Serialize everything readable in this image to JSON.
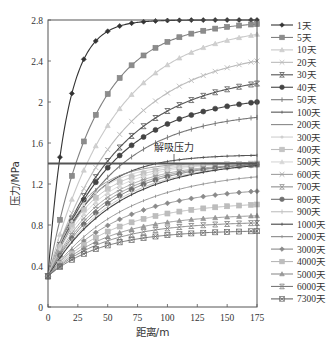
{
  "chart_data": {
    "type": "line",
    "title": "",
    "xlabel": "距离/m",
    "ylabel": "压力/MPa",
    "xlim": [
      0,
      175
    ],
    "ylim": [
      0,
      2.8
    ],
    "xticks": [
      0,
      25,
      50,
      75,
      100,
      125,
      150,
      175
    ],
    "yticks": [
      0,
      0.4,
      0.8,
      1.2,
      1.6,
      2,
      2.4,
      2.8
    ],
    "ytick_labels": [
      "0",
      "0.4",
      "0.8",
      "1.2",
      "1.6",
      "2",
      "2.4",
      "2.8"
    ],
    "grid": false,
    "legend_position": "right",
    "annotation": {
      "text": "解吸压力",
      "x": 100,
      "y": 1.4
    },
    "reference_line": {
      "name": "解吸压力",
      "y": 1.4,
      "color": "#555555"
    },
    "x": [
      0,
      10,
      20,
      30,
      40,
      50,
      60,
      70,
      80,
      90,
      100,
      110,
      120,
      130,
      140,
      150,
      160,
      170,
      175
    ],
    "series": [
      {
        "name": "1天",
        "final": 2.8,
        "k": 16,
        "color": "#333333",
        "marker": "diamond",
        "marker_fill": "#333333"
      },
      {
        "name": "5天",
        "final": 2.76,
        "k": 40,
        "color": "#808080",
        "marker": "square",
        "marker_fill": "#8c8c8c"
      },
      {
        "name": "10天",
        "final": 2.66,
        "k": 55,
        "color": "#c8c8c8",
        "marker": "triangle",
        "marker_fill": "#d0d0d0"
      },
      {
        "name": "20天",
        "final": 2.4,
        "k": 62,
        "color": "#bbbbbb",
        "marker": "x",
        "marker_fill": "#aaaaaa"
      },
      {
        "name": "30天",
        "final": 2.18,
        "k": 60,
        "color": "#555555",
        "marker": "xstar",
        "marker_fill": "#444444"
      },
      {
        "name": "40天",
        "final": 2.0,
        "k": 55,
        "color": "#444444",
        "marker": "circle",
        "marker_fill": "#444444"
      },
      {
        "name": "50天",
        "final": 1.85,
        "k": 55,
        "color": "#777777",
        "marker": "plus",
        "marker_fill": "#777777"
      },
      {
        "name": "100天",
        "final": 1.48,
        "k": 35,
        "color": "#555555",
        "marker": "dash",
        "marker_fill": "#555555"
      },
      {
        "name": "200天",
        "final": 1.41,
        "k": 28,
        "color": "#888888",
        "marker": "none",
        "marker_fill": "#888888"
      },
      {
        "name": "300天",
        "final": 1.4,
        "k": 30,
        "color": "#cfcfcf",
        "marker": "dot",
        "marker_fill": "#cfcfcf"
      },
      {
        "name": "400天",
        "final": 1.4,
        "k": 34,
        "color": "#bdbdbd",
        "marker": "square",
        "marker_fill": "#c4c4c4"
      },
      {
        "name": "500天",
        "final": 1.4,
        "k": 38,
        "color": "#d6d6d6",
        "marker": "triangle",
        "marker_fill": "#d6d6d6"
      },
      {
        "name": "600天",
        "final": 1.39,
        "k": 42,
        "color": "#a0a0a0",
        "marker": "x",
        "marker_fill": "#999999"
      },
      {
        "name": "700天",
        "final": 1.39,
        "k": 46,
        "color": "#909090",
        "marker": "xstar",
        "marker_fill": "#909090"
      },
      {
        "name": "800天",
        "final": 1.39,
        "k": 50,
        "color": "#707070",
        "marker": "circle",
        "marker_fill": "#707070"
      },
      {
        "name": "900天",
        "final": 1.38,
        "k": 54,
        "color": "#c0c0c0",
        "marker": "plus",
        "marker_fill": "#c0c0c0"
      },
      {
        "name": "1000天",
        "final": 1.38,
        "k": 58,
        "color": "#444444",
        "marker": "dash",
        "marker_fill": "#444444"
      },
      {
        "name": "2000天",
        "final": 1.27,
        "k": 65,
        "color": "#888888",
        "marker": "dash",
        "marker_fill": "#888888"
      },
      {
        "name": "3000天",
        "final": 1.13,
        "k": 60,
        "color": "#8a8a8a",
        "marker": "diamond",
        "marker_fill": "#8a8a8a"
      },
      {
        "name": "4000天",
        "final": 1.0,
        "k": 55,
        "color": "#b8b8b8",
        "marker": "square",
        "marker_fill": "#bdbdbd"
      },
      {
        "name": "5000天",
        "final": 0.89,
        "k": 50,
        "color": "#8f8f8f",
        "marker": "triangle",
        "marker_fill": "#999999"
      },
      {
        "name": "6000天",
        "final": 0.82,
        "k": 48,
        "color": "#7a7a7a",
        "marker": "xstar",
        "marker_fill": "#7a7a7a"
      },
      {
        "name": "7300天",
        "final": 0.74,
        "k": 45,
        "color": "#666666",
        "marker": "xsq",
        "marker_fill": "#666666"
      }
    ],
    "start_value": 0.3
  },
  "legend": {
    "items": [
      "1天",
      "5天",
      "10天",
      "20天",
      "30天",
      "40天",
      "50天",
      "100天",
      "200天",
      "300天",
      "400天",
      "500天",
      "600天",
      "700天",
      "800天",
      "900天",
      "1000天",
      "2000天",
      "3000天",
      "4000天",
      "5000天",
      "6000天",
      "7300天"
    ]
  }
}
